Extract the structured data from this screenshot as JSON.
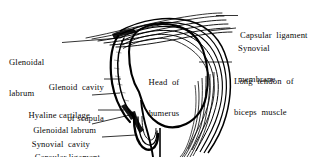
{
  "figure": {
    "background_color": "#ffffff",
    "ink_color": "#000000"
  },
  "labels_left": [
    {
      "id": "glenoidal-labrum-superior",
      "line1": "Glenoidal",
      "line2": "labrum"
    },
    {
      "id": "glenoid-cavity-of-scapula",
      "line1": "Glenoid  cavity",
      "line2": "of scapula"
    },
    {
      "id": "hyaline-cartilage",
      "line1": "Hyaline cartilage"
    },
    {
      "id": "glenoidal-labrum-inferior",
      "line1": "Glenoidal labrum"
    },
    {
      "id": "synovial-cavity",
      "line1": "Synovial  cavity"
    },
    {
      "id": "capsular-ligament-left",
      "line1": "Capsular ligament"
    }
  ],
  "labels_right": [
    {
      "id": "capsular-ligament-right",
      "line1": "Capsular  ligament"
    },
    {
      "id": "synovial-membrane",
      "line1": "Synovial",
      "line2": "membrane"
    },
    {
      "id": "long-tendon-of-biceps",
      "line1": "Long  tendon  of",
      "line2": "biceps  muscle"
    }
  ],
  "labels_center": [
    {
      "id": "head-of-humerus",
      "line1": "Head  of",
      "line2": "humerus"
    }
  ]
}
